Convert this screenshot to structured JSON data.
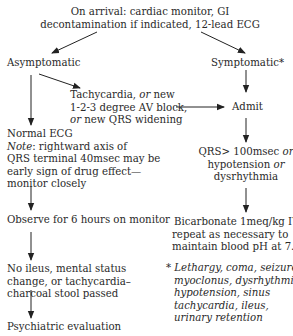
{
  "nodes": {
    "arrival": {
      "lines": [
        "On arrival: cardiac monitor, GI",
        "decontamination  if indicated, 12-lead ECG"
      ]
    },
    "asymptomatic": {
      "label": "Asymptomatic"
    },
    "symptomatic": {
      "label": "Symptomatic*"
    },
    "tachy": {
      "line1_a": "Tachycardia, ",
      "line1_em": "or",
      "line1_b": " new",
      "line2": "1-2-3 degree AV block,",
      "line3_em": "or",
      "line3_b": " new QRS widening"
    },
    "admit": {
      "label": "Admit"
    },
    "normal_ecg": {
      "line1": "Normal ECG",
      "line2_em": "Note",
      "line2_b": ": rightward axis of",
      "line3": "QRS terminal 40msec may be",
      "line4": "early sign of drug effect—",
      "line5": "monitor closely"
    },
    "qrs": {
      "line1_a": "QRS> 100msec ",
      "line1_em": "or",
      "line2_a": "hypotension ",
      "line2_em": "or",
      "line3": "dysrhythmia"
    },
    "observe": {
      "label": "Observe for 6 hours on monitor"
    },
    "bicarb": {
      "lines": [
        "Bicarbonate 1meq/kg IV,",
        "repeat as necessary to",
        "maintain blood pH at 7.50"
      ]
    },
    "no_ileus": {
      "lines": [
        "No ileus, mental status",
        "change, or tachycardia–",
        "charcoal stool passed"
      ]
    },
    "footnote": {
      "lines": [
        "* Lethargy, coma, seizures,",
        "myoclonus, dysrhythmia,",
        "hypotension, sinus",
        "tachycardia, ileus,",
        "urinary retention"
      ]
    },
    "psych": {
      "label": "Psychiatric evaluation"
    }
  },
  "colors": {
    "text": "#2a2a2a",
    "arrow": "#222222",
    "background": "#ffffff"
  }
}
